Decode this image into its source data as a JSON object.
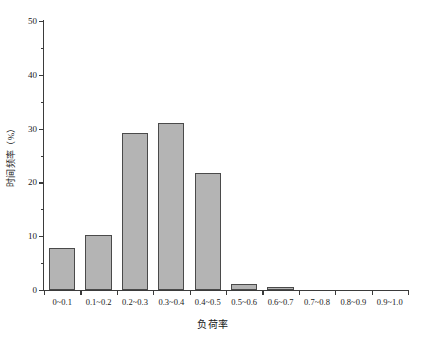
{
  "chart_data": {
    "type": "bar",
    "title": "",
    "xlabel": "负荷率",
    "ylabel": "时间频率（%）",
    "categories": [
      "0~0.1",
      "0.1~0.2",
      "0.2~0.3",
      "0.3~0.4",
      "0.4~0.5",
      "0.5~0.6",
      "0.6~0.7",
      "0.7~0.8",
      "0.8~0.9",
      "0.9~1.0"
    ],
    "values": [
      7.8,
      10.2,
      29.1,
      31.1,
      21.7,
      1.2,
      0.6,
      0,
      0,
      0
    ],
    "ylim": [
      0,
      50
    ],
    "xlim": [
      0,
      10
    ],
    "ytick_labels": [
      "0",
      "10",
      "20",
      "30",
      "40",
      "50"
    ],
    "ytick_values": [
      0,
      10,
      20,
      30,
      40,
      50
    ],
    "yminor_values": [
      5,
      15,
      25,
      35,
      45
    ],
    "grid": false,
    "legend": false,
    "bar_fill_color": "#b4b4b4",
    "bar_edge_color": "#4a4a4a",
    "axis_color": "#3b3b3b",
    "background_color": "#ffffff"
  }
}
